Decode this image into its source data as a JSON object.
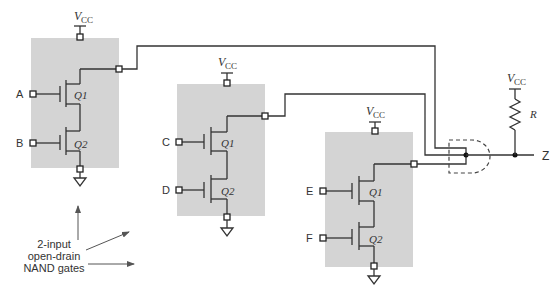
{
  "diagram": {
    "supply_label_main": "V",
    "supply_label_sub": "CC",
    "gates": [
      {
        "id": "gate1",
        "inputs": [
          "A",
          "B"
        ],
        "transistors": [
          "Q1",
          "Q2"
        ]
      },
      {
        "id": "gate2",
        "inputs": [
          "C",
          "D"
        ],
        "transistors": [
          "Q1",
          "Q2"
        ]
      },
      {
        "id": "gate3",
        "inputs": [
          "E",
          "F"
        ],
        "transistors": [
          "Q1",
          "Q2"
        ]
      }
    ],
    "pullup": {
      "resistor_label": "R"
    },
    "output_label": "Z",
    "annotation": {
      "line1": "2-input",
      "line2": "open-drain",
      "line3": "NAND gates"
    },
    "colors": {
      "gate_fill": "#d4d4d4",
      "wire": "#333333"
    }
  }
}
